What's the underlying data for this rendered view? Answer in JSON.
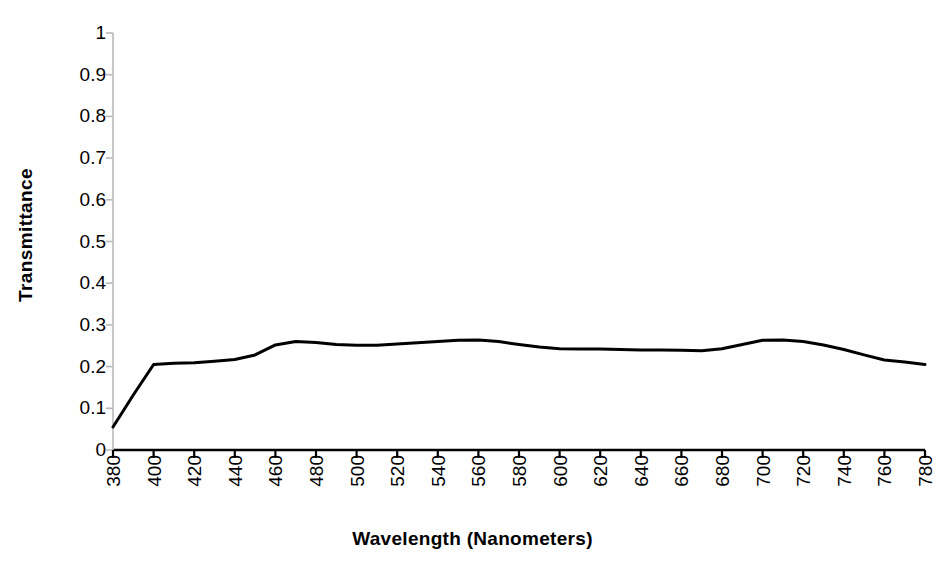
{
  "chart_data": {
    "type": "line",
    "title": "",
    "xlabel": "Wavelength  (Nanometers)",
    "ylabel": "Transmittance",
    "xlim": [
      380,
      780
    ],
    "ylim": [
      0,
      1
    ],
    "xticks": [
      380,
      400,
      420,
      440,
      460,
      480,
      500,
      520,
      540,
      560,
      580,
      600,
      620,
      640,
      660,
      680,
      700,
      720,
      740,
      760,
      780
    ],
    "xtick_labels": [
      "380",
      "400",
      "420",
      "440",
      "460",
      "480",
      "500",
      "520",
      "540",
      "560",
      "580",
      "600",
      "620",
      "640",
      "660",
      "680",
      "700",
      "720",
      "740",
      "760",
      "780"
    ],
    "yticks": [
      0,
      0.1,
      0.2,
      0.3,
      0.4,
      0.5,
      0.6,
      0.7,
      0.8,
      0.9,
      1
    ],
    "ytick_labels": [
      "0",
      "0.1",
      "0.2",
      "0.3",
      "0.4",
      "0.5",
      "0.6",
      "0.7",
      "0.8",
      "0.9",
      "1"
    ],
    "grid": false,
    "legend": null,
    "series": [
      {
        "name": "Transmittance",
        "color": "#000000",
        "line_width": 3,
        "x": [
          380,
          390,
          400,
          410,
          420,
          430,
          440,
          450,
          460,
          470,
          480,
          490,
          500,
          510,
          520,
          530,
          540,
          550,
          560,
          570,
          580,
          590,
          600,
          610,
          620,
          630,
          640,
          650,
          660,
          670,
          680,
          690,
          700,
          710,
          720,
          730,
          740,
          750,
          760,
          770,
          780
        ],
        "y": [
          0.055,
          0.132,
          0.205,
          0.208,
          0.209,
          0.213,
          0.217,
          0.228,
          0.252,
          0.26,
          0.258,
          0.253,
          0.251,
          0.251,
          0.254,
          0.257,
          0.26,
          0.263,
          0.264,
          0.26,
          0.253,
          0.247,
          0.243,
          0.242,
          0.242,
          0.241,
          0.24,
          0.24,
          0.239,
          0.238,
          0.243,
          0.253,
          0.263,
          0.264,
          0.26,
          0.252,
          0.241,
          0.228,
          0.216,
          0.211,
          0.205
        ]
      }
    ],
    "plot_area": {
      "left": 113,
      "right": 925,
      "top": 33,
      "bottom": 450
    },
    "axis_color": "#000000"
  }
}
